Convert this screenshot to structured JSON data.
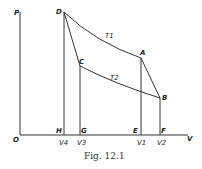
{
  "figure": {
    "caption": "Fig. 12.1",
    "axes": {
      "y_label": "P",
      "x_label": "V",
      "origin_label": "O"
    },
    "points": {
      "D": "D",
      "A": "A",
      "C": "C",
      "B": "B",
      "H": "H",
      "G": "G",
      "E": "E",
      "F": "F"
    },
    "curves": {
      "upper": "T1",
      "lower": "T2"
    },
    "volume_ticks": {
      "v4": "V4",
      "v3": "V3",
      "v1": "V1",
      "v2": "V2"
    }
  }
}
